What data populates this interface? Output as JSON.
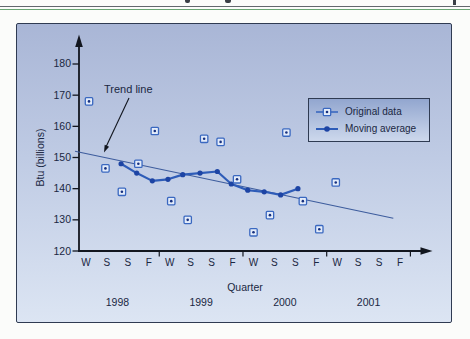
{
  "page": {
    "header_fragments": "cropped text remnants from page above",
    "rules": {
      "gray": "#63676d",
      "green": "#69a573"
    }
  },
  "chart": {
    "y_axis": {
      "title": "Btu (billions)"
    },
    "x_axis": {
      "title": "Quarter"
    },
    "annotation": {
      "label": "Trend line"
    },
    "legend": {
      "items": [
        {
          "label": "Original data",
          "marker": "boxed-square"
        },
        {
          "label": "Moving average",
          "marker": "dot-line"
        }
      ]
    },
    "colors": {
      "panel_bg_top": "#a9b6d6",
      "panel_bg_mid": "#bfcbe4",
      "panel_bg_bottom": "#dce5f3",
      "panel_border": "#2f3b52",
      "axis": "#12161f",
      "text": "#1a2742",
      "square_stroke": "#3a68c0",
      "square_fill": "#e4ecfa",
      "square_dot": "#16307f",
      "ma_line": "#2e5cb8",
      "ma_dot": "#1d44a4",
      "trend": "#3d5c9d",
      "legend_bg_top": "#92a6cf",
      "legend_bg_bottom": "#cdd8ec",
      "legend_border": "#2f3b52",
      "top_rule_gray": "#63676d",
      "top_rule_green": "#69a573"
    }
  },
  "chart_data": {
    "type": "line",
    "title": "",
    "xlabel": "Quarter",
    "ylabel": "Btu (billions)",
    "ylim": [
      120,
      185
    ],
    "y_ticks": [
      120,
      130,
      140,
      150,
      160,
      170,
      180
    ],
    "x_quarters": [
      "W",
      "S",
      "S",
      "F",
      "W",
      "S",
      "S",
      "F",
      "W",
      "S",
      "S",
      "F",
      "W",
      "S",
      "S",
      "F"
    ],
    "x_years": [
      "1998",
      "1999",
      "2000",
      "2001"
    ],
    "grid": false,
    "legend_position": "upper right",
    "series": [
      {
        "name": "Original data",
        "type": "scatter",
        "marker": "boxed-dot",
        "values": [
          168,
          146.5,
          139,
          148,
          158.5,
          136,
          130,
          156,
          155,
          143,
          126,
          131.5,
          158,
          136,
          127,
          142
        ]
      },
      {
        "name": "Moving average",
        "type": "line",
        "marker": "dot",
        "points": [
          [
            1.95,
            148
          ],
          [
            2.9,
            145
          ],
          [
            3.85,
            142.5
          ],
          [
            4.8,
            143
          ],
          [
            5.7,
            144.5
          ],
          [
            6.75,
            145
          ],
          [
            7.8,
            145.5
          ],
          [
            8.65,
            141.5
          ],
          [
            9.65,
            139.5
          ],
          [
            10.65,
            139
          ],
          [
            11.65,
            138
          ],
          [
            12.7,
            140
          ]
        ]
      },
      {
        "name": "Trend line",
        "type": "trend",
        "start_q": -0.85,
        "start_value": 152,
        "end_q": 18.5,
        "end_value": 130.5
      }
    ]
  }
}
